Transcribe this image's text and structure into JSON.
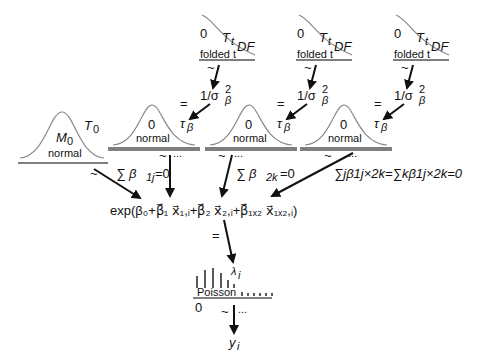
{
  "diagram": {
    "top_priors": [
      {
        "zero": "0",
        "dist": "T",
        "dist_sub": "t",
        "param": "DF",
        "name": "folded t",
        "tilde": "~",
        "target": "1/σ",
        "target_sub": "β",
        "target_sup": "2"
      },
      {
        "zero": "0",
        "dist": "T",
        "dist_sub": "t",
        "param": "DF",
        "name": "folded t",
        "tilde": "~",
        "target": "1/σ",
        "target_sub": "β",
        "target_sup": "2"
      },
      {
        "zero": "0",
        "dist": "T",
        "dist_sub": "t",
        "param": "DF",
        "name": "folded t",
        "tilde": "~",
        "target": "1/σ",
        "target_sub": "β",
        "target_sup": "2"
      }
    ],
    "intercept_prior": {
      "mean": "M",
      "mean_sub": "0",
      "prec": "T",
      "prec_sub": "0",
      "name": "normal",
      "tilde": "~"
    },
    "normal_priors": [
      {
        "mean": "0",
        "name": "normal",
        "eq": "=",
        "prec": "τ",
        "prec_sub": "β",
        "tilde": "~",
        "dots": "...",
        "constraint": "∑ β",
        "constraint_sub": "1j",
        "constraint_rhs": "=0"
      },
      {
        "mean": "0",
        "name": "normal",
        "eq": "=",
        "prec": "τ",
        "prec_sub": "β",
        "tilde": "~",
        "dots": "...",
        "constraint": "∑ β",
        "constraint_sub": "2k",
        "constraint_rhs": "=0"
      },
      {
        "mean": "0",
        "name": "normal",
        "eq": "=",
        "prec": "τ",
        "prec_sub": "β",
        "tilde": "~",
        "dots": "...",
        "constraint": "∑jβ1j×2k=∑kβ1j×2k=0"
      }
    ],
    "linear_predictor": "exp(β₀+β⃗₁ x⃗₁,ᵢ+β⃗₂ x⃗₂,ᵢ+β⃗₁ₓ₂ x⃗₁ₓ₂,ᵢ)",
    "lp_eq": "=",
    "likelihood": {
      "name": "Poisson",
      "zero": "0",
      "param": "λ",
      "param_sub": "i",
      "tilde": "~",
      "dots": "...",
      "data": "y",
      "data_sub": "i"
    }
  }
}
